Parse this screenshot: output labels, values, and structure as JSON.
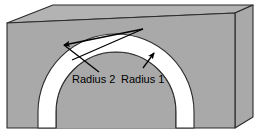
{
  "figure": {
    "background_color": "#ffffff",
    "width": 261,
    "height": 137
  },
  "colors": {
    "front_face": "#a9a9a9",
    "top_face": "#b3b3b3",
    "right_face": "#a9a9a9",
    "tunnel_face": "#a9a9a9",
    "arch_band": "#ffffff",
    "outline": "#2b2b2b",
    "thin_line": "#6f6f6f",
    "arrow": "#000000",
    "text": "#000000"
  },
  "labels": {
    "radius_outer": "Radius 2",
    "radius_inner": "Radius 1"
  },
  "annotations": [
    {
      "name": "radius-2-arrow",
      "label": "Radius 2",
      "from_x": 143,
      "from_y": 29,
      "to_x": 63,
      "to_y": 44,
      "target": "outer-arc"
    },
    {
      "name": "radius-1-arrow",
      "label": "Radius 1",
      "from_x": 143,
      "from_y": 29,
      "to_x": 152,
      "to_y": 54,
      "target": "inner-arc"
    }
  ],
  "geometry": {
    "arch_center_x": 116,
    "arch_center_y": 112,
    "outer_radius": 78,
    "inner_radius": 60,
    "band_width": 18
  }
}
